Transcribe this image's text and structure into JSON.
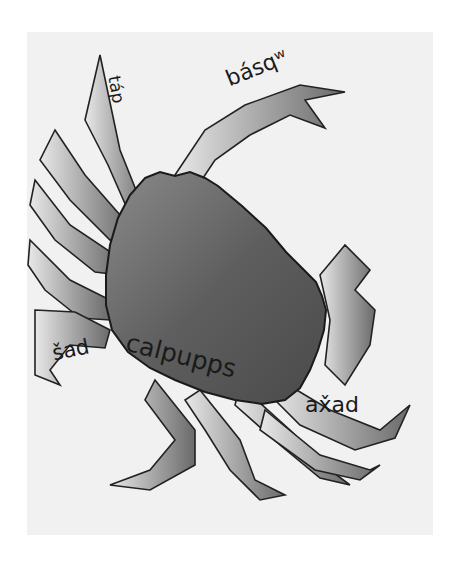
{
  "illustration": {
    "subject": "crab",
    "background_color": "#f1f1f1",
    "shell_color": "#6e6e6e",
    "leg_color": "#bdbdbd",
    "outline_color": "#222222"
  },
  "labels": {
    "claw": "básqʷ",
    "leg_tip": "táp",
    "claw_left": "šad",
    "body": "calpupps",
    "legs": "ax̌ad"
  }
}
